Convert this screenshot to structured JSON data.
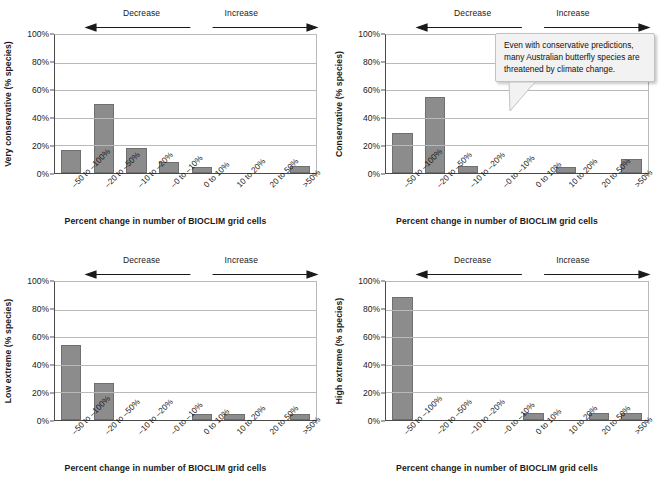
{
  "figure": {
    "axis_title": "Percent change in number of BIOCLIM grid cells",
    "direction_decrease": "Decrease",
    "direction_increase": "Increase",
    "bar_color": "#8c8c8c",
    "gridline_color": "#b9b9b9",
    "axis_color": "#4a4a4a"
  },
  "callout": {
    "text": "Even with conservative predictions, many Australian butterfly species are threatened by climate change."
  },
  "chart_data": [
    {
      "type": "bar",
      "panel": "top-left",
      "title": "",
      "ylabel": "Very conservative (% species)",
      "xlabel": "Percent change in number of BIOCLIM grid cells",
      "categories": [
        "–50 to –100%",
        "–20 to –50%",
        "–10 to –20%",
        "–0 to –10%",
        "0 to 10%",
        "10 to 20%",
        "20 to 50%",
        ">50%"
      ],
      "values": [
        17,
        50,
        18,
        8,
        4,
        0,
        0,
        5
      ],
      "ylim": [
        0,
        100
      ],
      "yticks": [
        "0%",
        "20%",
        "40%",
        "60%",
        "80%",
        "100%"
      ],
      "ytick_values": [
        0,
        20,
        40,
        60,
        80,
        100
      ],
      "grid": true,
      "legend": "none"
    },
    {
      "type": "bar",
      "panel": "top-right",
      "title": "",
      "ylabel": "Conservative (% species)",
      "xlabel": "Percent change in number of BIOCLIM grid cells",
      "categories": [
        "–50 to –100%",
        "–20 to –50%",
        "–10 to –20%",
        "–0 to –10%",
        "0 to 10%",
        "10 to 20%",
        "20 to 50%",
        ">50%"
      ],
      "values": [
        29,
        55,
        5,
        0,
        0,
        4,
        0,
        10
      ],
      "ylim": [
        0,
        100
      ],
      "yticks": [
        "0%",
        "20%",
        "40%",
        "60%",
        "80%",
        "100%"
      ],
      "ytick_values": [
        0,
        20,
        40,
        60,
        80,
        100
      ],
      "grid": true,
      "legend": "none"
    },
    {
      "type": "bar",
      "panel": "bottom-left",
      "title": "",
      "ylabel": "Low extreme (% species)",
      "xlabel": "Percent change in number of BIOCLIM grid cells",
      "categories": [
        "–50 to –100%",
        "–20 to –50%",
        "–10 to –20%",
        "–0 to –10%",
        "0 to 10%",
        "10 to 20%",
        "20 to 50%",
        ">50%"
      ],
      "values": [
        54,
        27,
        0,
        0,
        4,
        4,
        0,
        4
      ],
      "ylim": [
        0,
        100
      ],
      "yticks": [
        "0%",
        "20%",
        "40%",
        "60%",
        "80%",
        "100%"
      ],
      "ytick_values": [
        0,
        20,
        40,
        60,
        80,
        100
      ],
      "grid": true,
      "legend": "none"
    },
    {
      "type": "bar",
      "panel": "bottom-right",
      "title": "",
      "ylabel": "High extreme (% species)",
      "xlabel": "Percent change in number of BIOCLIM grid cells",
      "categories": [
        "–50 to –100%",
        "–20 to –50%",
        "–10 to –20%",
        "–0 to –10%",
        "0 to 10%",
        "10 to 20%",
        "20 to 50%",
        ">50%"
      ],
      "values": [
        89,
        0,
        0,
        0,
        5,
        0,
        5,
        5
      ],
      "ylim": [
        0,
        100
      ],
      "yticks": [
        "0%",
        "20%",
        "40%",
        "60%",
        "80%",
        "100%"
      ],
      "ytick_values": [
        0,
        20,
        40,
        60,
        80,
        100
      ],
      "grid": true,
      "legend": "none"
    }
  ]
}
